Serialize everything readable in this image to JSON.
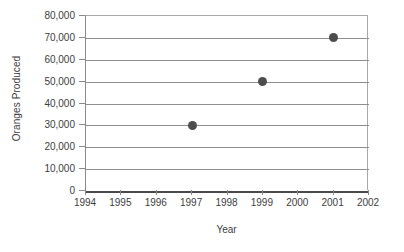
{
  "chart_data": {
    "type": "scatter",
    "title": "",
    "xlabel": "Year",
    "ylabel": "Oranges Produced",
    "x": [
      1997,
      1999,
      2001
    ],
    "values": [
      30000,
      50000,
      70000
    ],
    "series": [
      {
        "name": "Oranges Produced",
        "points": [
          {
            "x": 1997,
            "y": 30000
          },
          {
            "x": 1999,
            "y": 50000
          },
          {
            "x": 2001,
            "y": 70000
          }
        ]
      }
    ],
    "xlim": [
      1994,
      2002
    ],
    "ylim": [
      0,
      80000
    ],
    "x_tick_labels": [
      "1994",
      "1995",
      "1996",
      "1997",
      "1998",
      "1999",
      "2000",
      "2001",
      "2002"
    ],
    "x_tick_values": [
      1994,
      1995,
      1996,
      1997,
      1998,
      1999,
      2000,
      2001,
      2002
    ],
    "y_tick_labels": [
      "80,000",
      "70,000",
      "60,000",
      "50,000",
      "40,000",
      "30,000",
      "20,000",
      "10,000",
      "0"
    ],
    "y_tick_values": [
      80000,
      70000,
      60000,
      50000,
      40000,
      30000,
      20000,
      10000,
      0
    ],
    "grid": "horizontal",
    "legend": "none",
    "marker": "filled-circle",
    "marker_color": "#4d4d4d",
    "gridline_color": "#8e8e8e",
    "axis_color": "#8a8a8a",
    "baseline_color": "#4a4a4a",
    "background": "#ffffff"
  },
  "axes": {
    "y_title": "Oranges Produced",
    "x_title": "Year"
  }
}
